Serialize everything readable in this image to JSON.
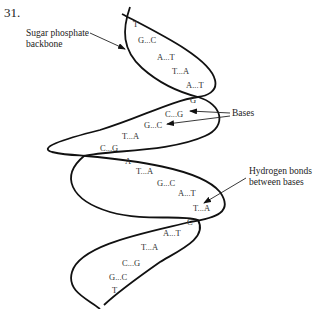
{
  "question_number": "31.",
  "labels": {
    "backbone_line1": "Sugar phosphate",
    "backbone_line2": "backbone",
    "bases": "Bases",
    "hbonds_line1": "Hydrogen bonds",
    "hbonds_line2": "between bases"
  },
  "base_pairs": [
    {
      "text": "T",
      "x": 133,
      "y": 27
    },
    {
      "text": "G...C",
      "x": 138,
      "y": 43
    },
    {
      "text": "A...T",
      "x": 157,
      "y": 60
    },
    {
      "text": "T...A",
      "x": 172,
      "y": 74
    },
    {
      "text": "A...T",
      "x": 186,
      "y": 88
    },
    {
      "text": "G",
      "x": 190,
      "y": 103
    },
    {
      "text": "C...G",
      "x": 165,
      "y": 117
    },
    {
      "text": "G...C",
      "x": 144,
      "y": 128
    },
    {
      "text": "T...A",
      "x": 122,
      "y": 139
    },
    {
      "text": "C...G",
      "x": 100,
      "y": 151
    },
    {
      "text": "A",
      "x": 125,
      "y": 164
    },
    {
      "text": "T...A",
      "x": 136,
      "y": 174
    },
    {
      "text": "G...C",
      "x": 157,
      "y": 186
    },
    {
      "text": "A...T",
      "x": 178,
      "y": 196
    },
    {
      "text": "T...A",
      "x": 193,
      "y": 211
    },
    {
      "text": "C",
      "x": 187,
      "y": 225
    },
    {
      "text": "A...T",
      "x": 163,
      "y": 236
    },
    {
      "text": "T...A",
      "x": 141,
      "y": 250
    },
    {
      "text": "C...G",
      "x": 122,
      "y": 266
    },
    {
      "text": "G...C",
      "x": 109,
      "y": 280
    },
    {
      "text": "T",
      "x": 112,
      "y": 293
    }
  ]
}
